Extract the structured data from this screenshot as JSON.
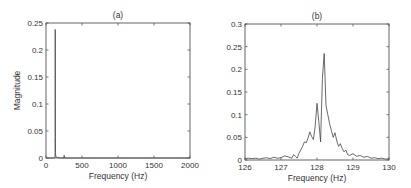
{
  "chart_data": [
    {
      "type": "line",
      "title": "(a)",
      "xlabel": "Frequency (Hz)",
      "ylabel": "Magnitude",
      "xlim": [
        0,
        2000
      ],
      "ylim": [
        0,
        0.25
      ],
      "xticks": [
        0,
        500,
        1000,
        1500,
        2000
      ],
      "yticks": [
        0,
        0.05,
        0.1,
        0.15,
        0.2,
        0.25
      ],
      "xtick_labels": [
        "0",
        "500",
        "1000",
        "1500",
        "2000"
      ],
      "ytick_labels": [
        "0",
        "0.05",
        "0.1",
        "0.15",
        "0.2",
        "0.25"
      ],
      "grid": false,
      "series": [
        {
          "name": "spectrum",
          "x": [
            0,
            120,
            124,
            126,
            127,
            128,
            128.2,
            129,
            130,
            132,
            136,
            200,
            250,
            252,
            256,
            300,
            2000
          ],
          "y": [
            0,
            0,
            0.002,
            0.01,
            0.04,
            0.12,
            0.238,
            0.1,
            0.04,
            0.01,
            0.002,
            0,
            0,
            0.005,
            0,
            0,
            0
          ]
        }
      ]
    },
    {
      "type": "line",
      "title": "(b)",
      "xlabel": "Frequency (Hz)",
      "ylabel": "",
      "xlim": [
        126,
        130
      ],
      "ylim": [
        0,
        0.3
      ],
      "xticks": [
        126,
        127,
        128,
        129,
        130
      ],
      "yticks": [
        0,
        0.05,
        0.1,
        0.15,
        0.2,
        0.25,
        0.3
      ],
      "xtick_labels": [
        "126",
        "127",
        "128",
        "129",
        "130"
      ],
      "ytick_labels": [
        "0",
        "0.05",
        "0.1",
        "0.15",
        "0.2",
        "0.25",
        "0.3"
      ],
      "grid": false,
      "series": [
        {
          "name": "spectrum (zoom)",
          "x": [
            126.0,
            126.1,
            126.2,
            126.3,
            126.4,
            126.5,
            126.6,
            126.7,
            126.8,
            126.9,
            127.0,
            127.1,
            127.2,
            127.3,
            127.35,
            127.4,
            127.45,
            127.5,
            127.55,
            127.6,
            127.65,
            127.7,
            127.75,
            127.8,
            127.85,
            127.9,
            127.95,
            128.0,
            128.05,
            128.1,
            128.15,
            128.2,
            128.25,
            128.3,
            128.35,
            128.4,
            128.45,
            128.5,
            128.55,
            128.6,
            128.65,
            128.7,
            128.75,
            128.8,
            128.85,
            128.9,
            129.0,
            129.1,
            129.2,
            129.3,
            129.4,
            129.5,
            129.6,
            129.7,
            129.8,
            129.9,
            130.0
          ],
          "y": [
            0.003,
            0.004,
            0.003,
            0.004,
            0.002,
            0.004,
            0.005,
            0.003,
            0.006,
            0.004,
            0.005,
            0.009,
            0.007,
            0.004,
            0.012,
            0.008,
            0.004,
            0.015,
            0.022,
            0.03,
            0.04,
            0.038,
            0.048,
            0.062,
            0.052,
            0.045,
            0.075,
            0.125,
            0.085,
            0.04,
            0.18,
            0.235,
            0.12,
            0.1,
            0.08,
            0.065,
            0.05,
            0.06,
            0.042,
            0.03,
            0.036,
            0.025,
            0.018,
            0.022,
            0.012,
            0.01,
            0.014,
            0.008,
            0.01,
            0.006,
            0.008,
            0.004,
            0.005,
            0.003,
            0.004,
            0.002,
            0.003
          ]
        }
      ]
    }
  ]
}
